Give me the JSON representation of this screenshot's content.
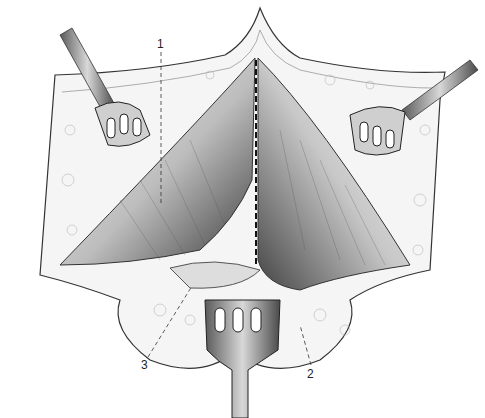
{
  "figure": {
    "labels": [
      {
        "id": "1",
        "text": "1",
        "x": 157,
        "y": 38
      },
      {
        "id": "2",
        "text": "2",
        "x": 307,
        "y": 368
      },
      {
        "id": "3",
        "text": "3",
        "x": 141,
        "y": 359
      }
    ],
    "colors": {
      "ink": "#222222",
      "shade": "#8a8a8a",
      "dark": "#3a3a3a",
      "tissue": "#e6e6e6"
    }
  }
}
